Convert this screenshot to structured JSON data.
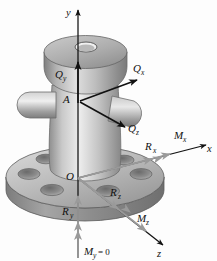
{
  "figure": {
    "type": "free-body-diagram",
    "background_color": "#fdfdfd",
    "body_color": "#a8a8a8",
    "body_highlight": "#e2e2e2",
    "body_shadow": "#6e6e6e",
    "force_color": "#111111",
    "moment_color": "#9a9a9a"
  },
  "axes": [
    {
      "name": "y-axis",
      "label": "y",
      "direction": "up",
      "arrow": "single"
    },
    {
      "name": "x-axis",
      "label": "x",
      "direction": "right-up",
      "arrow": "single"
    },
    {
      "name": "z-axis",
      "label": "z",
      "direction": "right-down",
      "arrow": "single"
    }
  ],
  "points": [
    {
      "name": "point-a",
      "label": "A",
      "description": "load application point on bollard"
    },
    {
      "name": "origin",
      "label": "O",
      "description": "origin at base flange center"
    }
  ],
  "forces": [
    {
      "name": "force-qy",
      "label": "Q",
      "sub": "y",
      "at": "A",
      "direction": "up",
      "color": "#111111"
    },
    {
      "name": "force-qx",
      "label": "Q",
      "sub": "x",
      "at": "A",
      "direction": "right-up",
      "color": "#111111"
    },
    {
      "name": "force-qz",
      "label": "Q",
      "sub": "z",
      "at": "A",
      "direction": "right-down",
      "color": "#111111"
    },
    {
      "name": "reaction-rx",
      "label": "R",
      "sub": "x",
      "at": "O",
      "direction": "right-up",
      "color": "#9a9a9a"
    },
    {
      "name": "reaction-ry",
      "label": "R",
      "sub": "y",
      "at": "O",
      "direction": "down",
      "color": "#9a9a9a"
    },
    {
      "name": "reaction-rz",
      "label": "R",
      "sub": "z",
      "at": "O",
      "direction": "right-down",
      "color": "#9a9a9a"
    }
  ],
  "moments": [
    {
      "name": "moment-mx",
      "label": "M",
      "sub": "x",
      "at": "O",
      "direction": "right-up",
      "arrow": "double",
      "color": "#9a9a9a"
    },
    {
      "name": "moment-mz",
      "label": "M",
      "sub": "z",
      "at": "O",
      "direction": "right-down",
      "arrow": "double",
      "color": "#9a9a9a"
    },
    {
      "name": "moment-my",
      "label": "M",
      "sub": "y",
      "at": "O",
      "direction": "down",
      "arrow": "double",
      "color": "#9a9a9a",
      "value_text": "= 0",
      "full_text": "M_y = 0"
    }
  ],
  "geometry": {
    "flange": {
      "name": "base-flange",
      "bolt_hole_count": 6
    },
    "column": {
      "name": "bollard-column"
    },
    "head": {
      "name": "bollard-head",
      "top_hole": true
    },
    "horns": {
      "name": "bollard-horns",
      "count": 2
    }
  }
}
